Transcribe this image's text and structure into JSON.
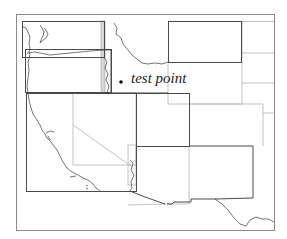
{
  "map": {
    "title": "",
    "point_label": "test point",
    "point": {
      "x": 121,
      "y": 82
    },
    "colors": {
      "frame": "#8c8c8c",
      "dark_box": "#4a4a4a",
      "light_line": "#b4b4b4",
      "coastline": "#3a3a3a",
      "point": "#111111"
    },
    "regions": [
      {
        "name": "washington-box",
        "style": "dark"
      },
      {
        "name": "oregon-box",
        "style": "dark"
      },
      {
        "name": "california-box",
        "style": "dark"
      },
      {
        "name": "nevada-box",
        "style": "light"
      },
      {
        "name": "montana-wyoming-box",
        "style": "dark"
      },
      {
        "name": "utah-box",
        "style": "dark"
      },
      {
        "name": "colorado-box",
        "style": "light"
      },
      {
        "name": "arizona-new-mexico-box",
        "style": "light"
      }
    ]
  }
}
